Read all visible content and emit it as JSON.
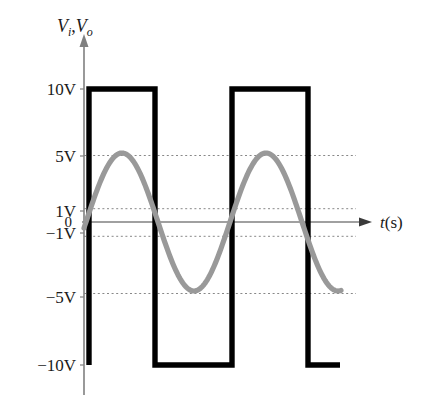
{
  "figure": {
    "y_axis_title": "Vi,Vo",
    "y_axis_title_parts": {
      "v1": "V",
      "sub1": "i",
      "comma": ",",
      "v2": "V",
      "sub2": "o"
    },
    "x_axis_title": "t(s)",
    "x_axis_title_parts": {
      "t": "t",
      "unit": "(s)"
    },
    "origin_label": "0"
  },
  "y_ticks": [
    {
      "label": "10V",
      "value": 10,
      "y": 89
    },
    {
      "label": "5V",
      "value": 5,
      "y": 156
    },
    {
      "label": "1V",
      "value": 1,
      "y": 211
    },
    {
      "label": "0",
      "value": 0,
      "y": 222
    },
    {
      "label": "−1V",
      "value": -1,
      "y": 233
    },
    {
      "label": "−5V",
      "value": -5,
      "y": 297
    },
    {
      "label": "−10V",
      "value": -10,
      "y": 365
    }
  ],
  "colors": {
    "square_wave": "#000000",
    "sine_wave": "#999999",
    "axis": "#808080",
    "gridline": "#888888",
    "background": "#ffffff",
    "text": "#1a1a1a"
  },
  "chart_data": {
    "type": "line",
    "title": "",
    "xlabel": "t(s)",
    "ylabel": "Vi,Vo",
    "ylim": [
      -10,
      10
    ],
    "xlim": [
      0,
      2.05
    ],
    "grid": true,
    "gridlines_y": [
      5,
      1,
      -1,
      -5
    ],
    "legend_position": "none",
    "axis_tick_labels": [
      "10V",
      "5V",
      "1V",
      "0",
      "−1V",
      "−5V",
      "−10V"
    ],
    "series": [
      {
        "name": "Vo (output square wave)",
        "type": "square",
        "color": "#000000",
        "amplitude": 10,
        "high_level": 10,
        "low_level": -10,
        "description": "Comparator output: +10V while input rises past +1V, −10V after input falls past −1V",
        "points": [
          [
            0.0,
            -10
          ],
          [
            0.0,
            10
          ],
          [
            0.58,
            10
          ],
          [
            0.58,
            -10
          ],
          [
            1.09,
            -10
          ],
          [
            1.09,
            10
          ],
          [
            1.69,
            10
          ],
          [
            1.69,
            -10
          ],
          [
            2.05,
            -10
          ]
        ]
      },
      {
        "name": "Vi (input sine wave)",
        "type": "sine",
        "color": "#999999",
        "amplitude": 5,
        "peak": 5,
        "trough": -5,
        "period": 1.12,
        "phase_start_value": 0,
        "description": "Input sinusoid, 5V peak amplitude, starts at 0V rising",
        "key_points": [
          [
            0.0,
            0
          ],
          [
            0.28,
            5
          ],
          [
            0.56,
            0
          ],
          [
            0.84,
            -5
          ],
          [
            1.12,
            0
          ],
          [
            1.4,
            5
          ],
          [
            1.68,
            0
          ],
          [
            1.96,
            -5
          ]
        ]
      }
    ]
  },
  "geometry": {
    "y_axis_x": 84,
    "x_axis_y": 222,
    "plot_right": 360,
    "y_axis_top": 38,
    "y_axis_bottom": 395,
    "square_edges_x": [
      89,
      155,
      232,
      308,
      340
    ],
    "sine_start_x": 84,
    "sine_end_x": 341,
    "sine_peak1_x": 122,
    "sine_trough1_x": 198,
    "sine_peak2_x": 266,
    "grid_right_x": 356
  }
}
